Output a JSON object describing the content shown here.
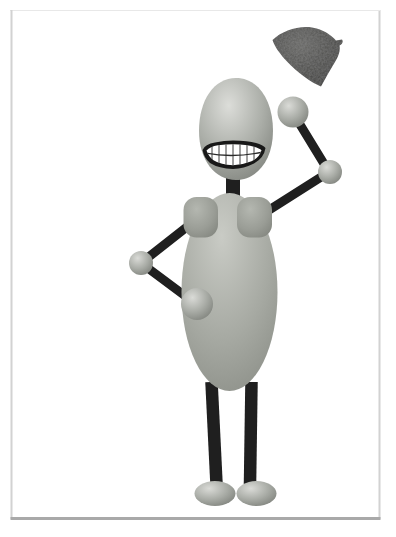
{
  "image": {
    "title": "Cartoon robot tossing hat",
    "description": "Clip-art cartoon of a smiling egg-headed stick figure standing inside a thin gray picture frame, left hand on hip, right arm raised after tossing a dark beret-style hat into the air",
    "background": "#ffffff"
  },
  "frame": {
    "side_color": "#d2d2d2",
    "top_color": "#e8e8e8",
    "bottom_color": "#a9a9a9"
  },
  "palette": {
    "head_light": "#dcddd9",
    "head_mid": "#abaea8",
    "head_dark": "#7e817b",
    "body_light": "#c9cbc5",
    "body_mid": "#a6a9a2",
    "body_dark": "#878a83",
    "pad_light": "#b4b7b0",
    "pad_mid": "#9a9d96",
    "pad_dark": "#82857e",
    "ball_light": "#dadbd7",
    "ball_mid": "#a9aca6",
    "ball_dark": "#7f827c",
    "limb": "#1f1f1f",
    "hat_light": "#646462",
    "hat_mid": "#484846",
    "hat_dark": "#343432",
    "mouth_outline": "#181818",
    "teeth": "#ffffff",
    "tooth_line": "#2b2b2b"
  }
}
